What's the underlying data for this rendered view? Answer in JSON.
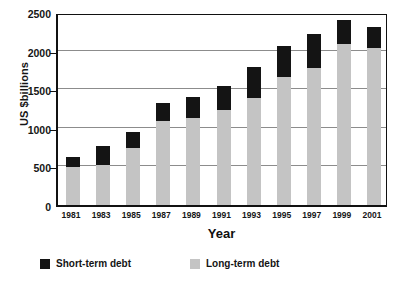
{
  "chart_data": {
    "type": "bar",
    "stacked": true,
    "title": "",
    "xlabel": "Year",
    "ylabel": "US $billions",
    "categories": [
      "1981",
      "1983",
      "1985",
      "1987",
      "1989",
      "1991",
      "1993",
      "1995",
      "1997",
      "1999",
      "2001"
    ],
    "ylim": [
      0,
      2500
    ],
    "yticks": [
      0,
      500,
      1000,
      1500,
      2000,
      2500
    ],
    "ytick_labels": [
      "0",
      "500",
      "1000",
      "1500",
      "2000",
      "2500"
    ],
    "grid": true,
    "legend_position": "bottom",
    "series": [
      {
        "name": "Long-term debt",
        "color": "#c4c4c4",
        "values": [
          490,
          520,
          740,
          1090,
          1130,
          1230,
          1390,
          1660,
          1780,
          2080,
          2040
        ]
      },
      {
        "name": "Short-term debt",
        "color": "#141414",
        "values": [
          130,
          240,
          210,
          230,
          270,
          310,
          400,
          400,
          430,
          320,
          260
        ]
      }
    ],
    "totals": [
      620,
      760,
      950,
      1320,
      1400,
      1540,
      1790,
      2060,
      2210,
      2400,
      2300
    ]
  },
  "legend": {
    "items": [
      {
        "label": "Short-term debt",
        "swatch": "#141414"
      },
      {
        "label": "Long-term debt",
        "swatch": "#c4c4c4"
      }
    ]
  }
}
